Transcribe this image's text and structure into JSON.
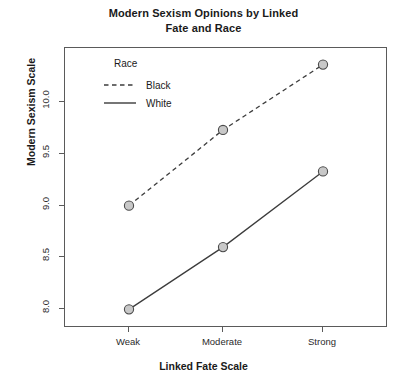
{
  "chart_data": {
    "type": "line",
    "title": "Modern Sexism Opinions by Linked\nFate and Race",
    "xlabel": "Linked Fate Scale",
    "ylabel": "Modern Sexism Scale",
    "categories": [
      "Weak",
      "Moderate",
      "Strong"
    ],
    "series": [
      {
        "name": "Black",
        "values": [
          9.0,
          9.73,
          10.36
        ],
        "linestyle": "dashed",
        "color": "#3c3c3c",
        "marker": "circle",
        "marker_fill": "#c8c8c8"
      },
      {
        "name": "White",
        "values": [
          8.0,
          8.6,
          9.33
        ],
        "linestyle": "solid",
        "color": "#3c3c3c",
        "marker": "circle",
        "marker_fill": "#c8c8c8"
      }
    ],
    "ylim": [
      7.82,
      10.52
    ],
    "yticks": [
      8.0,
      8.5,
      9.0,
      9.5,
      10.0
    ],
    "ytick_labels": [
      "8.0",
      "8.5",
      "9.0",
      "9.5",
      "10.0"
    ],
    "grid": false,
    "legend": {
      "title": "Race",
      "position": "top-left-inside",
      "entries": [
        "Black",
        "White"
      ]
    }
  },
  "colors": {
    "line": "#3c3c3c",
    "marker_fill": "#c8c8c8",
    "marker_edge": "#4a4a4a",
    "panel_border": "#5a5a5a",
    "text": "#1a1a1a",
    "background": "#ffffff"
  }
}
